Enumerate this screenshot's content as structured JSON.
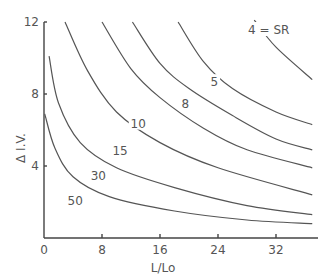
{
  "chart_data": {
    "type": "line",
    "title": "",
    "xlabel": "L/Lo",
    "ylabel": "Δ I.V.",
    "xlim": [
      0,
      37
    ],
    "ylim": [
      0,
      12
    ],
    "x_ticks": [
      "0",
      "8",
      "16",
      "24",
      "32"
    ],
    "y_ticks": [
      "4",
      "8",
      "12"
    ],
    "grid": false,
    "legend": "inline curve labels",
    "series": [
      {
        "name": "4 = SR",
        "label": "4 = SR",
        "points": [
          [
            29,
            12.1
          ],
          [
            32,
            10.6
          ],
          [
            37,
            8.8
          ]
        ]
      },
      {
        "name": "5",
        "label": "5",
        "points": [
          [
            18.5,
            12
          ],
          [
            22,
            9.8
          ],
          [
            26,
            8.3
          ],
          [
            32,
            7.0
          ],
          [
            37,
            6.3
          ]
        ]
      },
      {
        "name": "8",
        "label": "8",
        "points": [
          [
            12.2,
            12
          ],
          [
            16,
            9.7
          ],
          [
            20,
            8.3
          ],
          [
            26,
            6.8
          ],
          [
            32,
            5.5
          ],
          [
            37,
            4.9
          ]
        ]
      },
      {
        "name": "10",
        "label": "10",
        "points": [
          [
            8,
            12
          ],
          [
            12,
            9.4
          ],
          [
            16,
            7.8
          ],
          [
            22,
            6.1
          ],
          [
            28,
            4.9
          ],
          [
            37,
            3.9
          ]
        ]
      },
      {
        "name": "15",
        "label": "15",
        "points": [
          [
            2.9,
            12
          ],
          [
            6,
            9.3
          ],
          [
            10,
            7.0
          ],
          [
            16,
            5.3
          ],
          [
            24,
            3.9
          ],
          [
            37,
            2.4
          ]
        ]
      },
      {
        "name": "30",
        "label": "30",
        "points": [
          [
            0.7,
            10.1
          ],
          [
            2,
            7.5
          ],
          [
            5,
            5.3
          ],
          [
            10,
            3.9
          ],
          [
            18,
            2.8
          ],
          [
            28,
            1.8
          ],
          [
            37,
            1.3
          ]
        ]
      },
      {
        "name": "50",
        "label": "50",
        "points": [
          [
            0.1,
            6.9
          ],
          [
            1.5,
            5.0
          ],
          [
            4,
            3.4
          ],
          [
            9,
            2.3
          ],
          [
            18,
            1.5
          ],
          [
            28,
            1.0
          ],
          [
            37,
            0.8
          ]
        ]
      }
    ],
    "label_positions": {
      "4 = SR": [
        31,
        11.5
      ],
      "5": [
        23.5,
        8.6
      ],
      "8": [
        19.5,
        7.4
      ],
      "10": [
        13,
        6.3
      ],
      "15": [
        10.5,
        4.8
      ],
      "30": [
        7.5,
        3.4
      ],
      "50": [
        4.3,
        2.0
      ]
    }
  }
}
